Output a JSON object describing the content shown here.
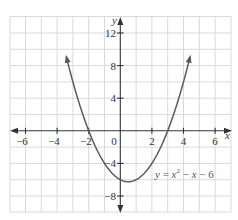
{
  "chart_data": {
    "type": "line",
    "title": "",
    "xlabel": "x",
    "ylabel": "y",
    "xlim": [
      -7,
      7
    ],
    "ylim": [
      -10,
      14
    ],
    "grid": true,
    "x_ticks": [
      -6,
      -4,
      -2,
      0,
      2,
      4,
      6
    ],
    "x_tick_labels": [
      "−6",
      "−4",
      "−2",
      "0",
      "2",
      "4",
      "6"
    ],
    "y_ticks": [
      12,
      8,
      4,
      -4,
      -8
    ],
    "y_tick_labels": [
      "12",
      "8",
      "4",
      "−4",
      "−8"
    ],
    "series": [
      {
        "name": "y = x^2 - x - 6",
        "function": "x^2 - x - 6",
        "x_range": [
          -3.4,
          4.4
        ],
        "x": [
          -3.4,
          -3,
          -2,
          -1,
          0,
          0.5,
          1,
          2,
          3,
          4,
          4.4
        ],
        "y": [
          8.96,
          6,
          0,
          -4,
          -6,
          -6.25,
          -6,
          -4,
          0,
          6,
          8.96
        ],
        "color": "#555555"
      }
    ],
    "annotations": [
      {
        "text": "y = x² − x − 6",
        "x": 4.5,
        "y": -5
      }
    ],
    "colors": {
      "curve": "#5a5a5a",
      "axis": "#333333",
      "grid": "#d9d9d9"
    }
  },
  "labels": {
    "x_axis": "x",
    "y_axis": "y",
    "origin": "0",
    "equation_y": "y",
    "equation_eq": " = ",
    "equation_x": "x",
    "equation_sup": "2",
    "equation_rest": " − ",
    "equation_x2": "x",
    "equation_tail": " − 6",
    "xt_m6": "−6",
    "xt_m4": "−4",
    "xt_m2": "−2",
    "xt_2": "2",
    "xt_4": "4",
    "xt_6": "6",
    "yt_12": "12",
    "yt_8": "8",
    "yt_4": "4",
    "yt_m4": "−4",
    "yt_m8": "−8"
  }
}
